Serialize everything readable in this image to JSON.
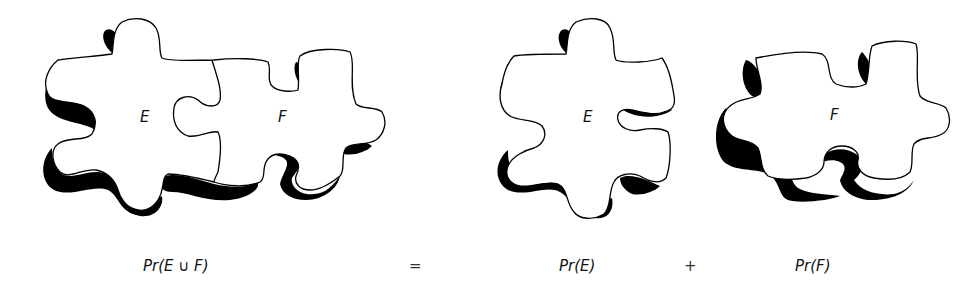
{
  "figure": {
    "panels": [
      {
        "id": "union",
        "pieces": [
          "E",
          "F"
        ],
        "description": "two interlocking puzzle pieces"
      },
      {
        "id": "piece-e",
        "pieces": [
          "E"
        ]
      },
      {
        "id": "piece-f",
        "pieces": [
          "F"
        ]
      }
    ],
    "labels": {
      "union_e": "E",
      "union_f": "F",
      "single_e": "E",
      "single_f": "F"
    },
    "formula": {
      "lhs": "Pr(E ∪ F)",
      "equals": "=",
      "term1": "Pr(E)",
      "plus": "+",
      "term2": "Pr(F)"
    },
    "colors": {
      "outline": "#000000",
      "shadow": "#000000",
      "fill": "#ffffff"
    }
  }
}
